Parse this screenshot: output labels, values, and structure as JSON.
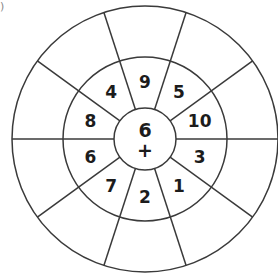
{
  "corner_label": ")",
  "wheel": {
    "center": {
      "x": 145,
      "y": 139
    },
    "radii": {
      "inner": 31,
      "middle": 82,
      "outer": 133
    },
    "sector_count": 10,
    "line_color": "#3a3a3a",
    "center_number": "6",
    "center_operator": "+",
    "middle_ring_numbers": [
      {
        "angle_deg": 90,
        "value": "9"
      },
      {
        "angle_deg": 54,
        "value": "5"
      },
      {
        "angle_deg": 18,
        "value": "10"
      },
      {
        "angle_deg": -18,
        "value": "3"
      },
      {
        "angle_deg": -54,
        "value": "1"
      },
      {
        "angle_deg": -90,
        "value": "2"
      },
      {
        "angle_deg": -126,
        "value": "7"
      },
      {
        "angle_deg": -162,
        "value": "6"
      },
      {
        "angle_deg": 162,
        "value": "8"
      },
      {
        "angle_deg": 126,
        "value": "4"
      }
    ],
    "outer_ring_values": [
      "",
      "",
      "",
      "",
      "",
      "",
      "",
      "",
      "",
      ""
    ]
  }
}
